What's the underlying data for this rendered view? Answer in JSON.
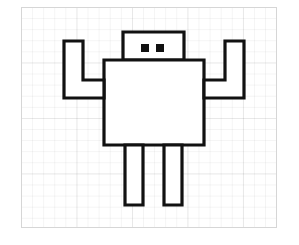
{
  "document": {
    "title": "Robot line drawing on graph paper",
    "background_color": "#ffffff",
    "paper": {
      "name": "graph-paper",
      "border_color": "#d6d6d6",
      "fill_color": "#ffffff",
      "x": 21,
      "y": 7,
      "width": 256,
      "height": 221,
      "grid": {
        "minor_spacing_px": 11.1,
        "minor_color": "rgba(0,0,0,0.045)",
        "major_spacing_px": 55.5,
        "major_color": "rgba(0,0,0,0.055)"
      }
    }
  },
  "drawing": {
    "name": "robot-figure",
    "stroke_color": "#111111",
    "fill_color": "#ffffff",
    "stroke_width": 3.2,
    "parts": [
      {
        "name": "head",
        "shape": "rectangle",
        "points": "123,32 184,32 184,60 123,60",
        "x": 123,
        "y": 32,
        "width": 61,
        "height": 28
      },
      {
        "name": "left-eye",
        "shape": "square",
        "points": "141,44 149,44 149,52 141,52",
        "x": 141,
        "y": 44,
        "width": 8,
        "height": 8,
        "fill": "#111111"
      },
      {
        "name": "right-eye",
        "shape": "square",
        "points": "156,44 164,44 164,52 156,52",
        "x": 156,
        "y": 44,
        "width": 8,
        "height": 8,
        "fill": "#111111"
      },
      {
        "name": "torso",
        "shape": "rectangle",
        "points": "104,60 204,60 204,145 104,145",
        "x": 104,
        "y": 60,
        "width": 100,
        "height": 85
      },
      {
        "name": "left-arm",
        "shape": "bent-arm-polygon",
        "points": "64,41 83,41 83,80 104,80 104,98 64,98",
        "description": "L-shaped arm raised upward on the left side"
      },
      {
        "name": "right-arm",
        "shape": "bent-arm-polygon",
        "points": "244,41 225,41 225,80 204,80 204,98 244,98",
        "description": "L-shaped arm raised upward on the right side"
      },
      {
        "name": "left-leg",
        "shape": "rectangle",
        "points": "125,145 143,145 143,205 125,205",
        "x": 125,
        "y": 145,
        "width": 18,
        "height": 60
      },
      {
        "name": "right-leg",
        "shape": "rectangle",
        "points": "164,145 182,145 182,205 164,205",
        "x": 164,
        "y": 145,
        "width": 18,
        "height": 60
      }
    ]
  }
}
